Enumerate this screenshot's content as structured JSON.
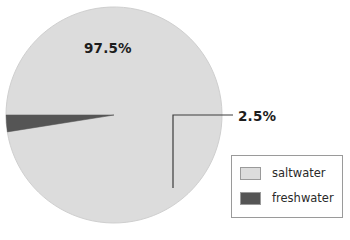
{
  "chart_data": {
    "type": "pie",
    "title": "",
    "categories": [
      "saltwater",
      "freshwater"
    ],
    "values": [
      97.5,
      2.5
    ],
    "unit": "%",
    "data_labels": [
      "97.5%",
      "2.5%"
    ],
    "colors": [
      "#dcdcdc",
      "#555555"
    ],
    "legend": {
      "position": "bottom-right",
      "entries": [
        {
          "label": "saltwater",
          "color": "#dcdcdc"
        },
        {
          "label": "freshwater",
          "color": "#555555"
        }
      ]
    },
    "annotations": [
      {
        "text": "97.5%",
        "placement": "inside-slice",
        "slice": "saltwater"
      },
      {
        "text": "2.5%",
        "placement": "callout-right",
        "slice": "freshwater",
        "leader_line": true
      }
    ],
    "grid": false,
    "xlabel": "",
    "ylabel": ""
  },
  "figure": {
    "background_color": "#ffffff",
    "pie": {
      "center_x": 114,
      "center_y": 115,
      "radius": 108,
      "slices": [
        {
          "name": "saltwater",
          "percent": 97.5,
          "color": "#dcdcdc",
          "start_angle_deg": 203.5,
          "end_angle_deg": 194.5
        },
        {
          "name": "freshwater",
          "percent": 2.5,
          "color": "#555555",
          "start_angle_deg": 194.5,
          "end_angle_deg": 203.5
        }
      ],
      "stroke_color": "#c8c8c8"
    },
    "callout": {
      "line_color": "#3c3c3c",
      "line_width": 1.2,
      "label": "2.5%"
    },
    "labels": {
      "major_percent": "97.5%",
      "minor_percent": "2.5%"
    },
    "legend_border_color": "#9a9a9a",
    "legend_background": "#ffffff"
  }
}
